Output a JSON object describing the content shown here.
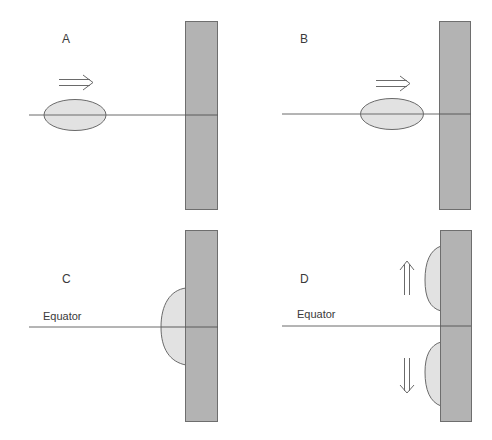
{
  "colors": {
    "background": "#ffffff",
    "wall_fill": "#b3b3b3",
    "wall_stroke": "#6e6e6e",
    "blob_fill": "#e2e2e2",
    "blob_stroke": "#6a6a6a",
    "line": "#6a6a6a",
    "text": "#3a3a3a"
  },
  "panels": [
    {
      "id": "A",
      "label": "A",
      "equator_label": "",
      "motion": "right",
      "description": "Oval body moving right along equator toward wall, far from wall"
    },
    {
      "id": "B",
      "label": "B",
      "equator_label": "",
      "motion": "right",
      "description": "Oval body moving right along equator, close to wall"
    },
    {
      "id": "C",
      "label": "C",
      "equator_label": "Equator",
      "motion": "none",
      "description": "Body flattened against wall, centered on equator"
    },
    {
      "id": "D",
      "label": "D",
      "equator_label": "Equator",
      "motion": "split",
      "description": "Body split into two halves moving poleward (up and down) along wall"
    }
  ]
}
